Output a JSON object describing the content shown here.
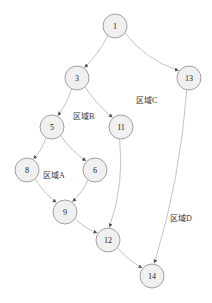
{
  "diagram": {
    "type": "control-flow-graph",
    "colors": {
      "node_fill": "#f0f0f0",
      "node_stroke": "#8a8a8a",
      "edge": "#b4b4b4",
      "arrow": "#555555",
      "text": "#222222"
    },
    "nodes": [
      {
        "id": "1",
        "label": "1",
        "x": 115,
        "y": 26
      },
      {
        "id": "3",
        "label": "3",
        "x": 77,
        "y": 78
      },
      {
        "id": "13",
        "label": "13",
        "x": 189,
        "y": 78
      },
      {
        "id": "5",
        "label": "5",
        "x": 52,
        "y": 127
      },
      {
        "id": "11",
        "label": "11",
        "x": 121,
        "y": 127
      },
      {
        "id": "8",
        "label": "8",
        "x": 27,
        "y": 170
      },
      {
        "id": "6",
        "label": "6",
        "x": 95,
        "y": 170
      },
      {
        "id": "9",
        "label": "9",
        "x": 65,
        "y": 212
      },
      {
        "id": "12",
        "label": "12",
        "x": 108,
        "y": 240
      },
      {
        "id": "14",
        "label": "14",
        "x": 152,
        "y": 276
      }
    ],
    "edges": [
      {
        "from": "1",
        "to": "3"
      },
      {
        "from": "1",
        "to": "13"
      },
      {
        "from": "3",
        "to": "5"
      },
      {
        "from": "3",
        "to": "11"
      },
      {
        "from": "5",
        "to": "8"
      },
      {
        "from": "5",
        "to": "6"
      },
      {
        "from": "8",
        "to": "9"
      },
      {
        "from": "6",
        "to": "9"
      },
      {
        "from": "11",
        "to": "12"
      },
      {
        "from": "9",
        "to": "12"
      },
      {
        "from": "12",
        "to": "14"
      },
      {
        "from": "13",
        "to": "14"
      }
    ],
    "regions": [
      {
        "id": "A",
        "label": "区域A",
        "x": 43,
        "y": 178
      },
      {
        "id": "B",
        "label": "区域B",
        "x": 73,
        "y": 119
      },
      {
        "id": "C",
        "label": "区域C",
        "x": 136,
        "y": 103
      },
      {
        "id": "D",
        "label": "区域D",
        "x": 170,
        "y": 221
      }
    ]
  }
}
